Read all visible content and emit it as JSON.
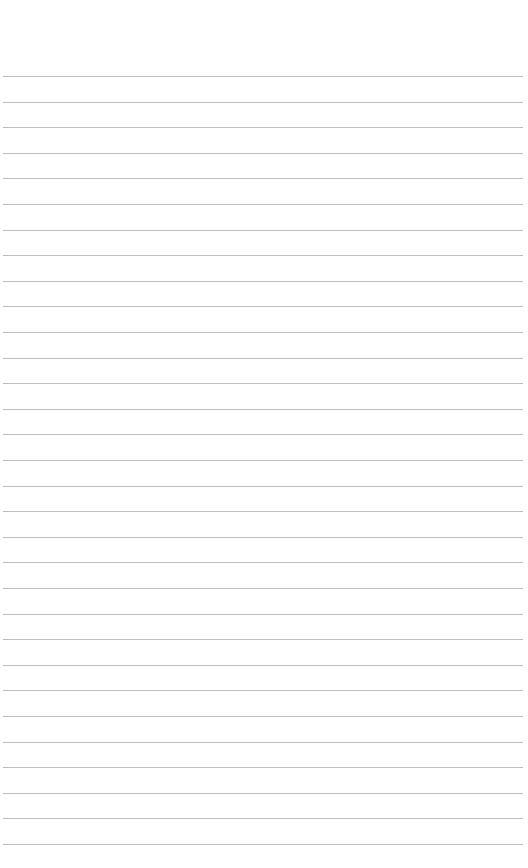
{
  "document": {
    "type": "ruled-paper",
    "background_color": "#ffffff",
    "rule_color": "#bdbdbd",
    "rule_count": 31,
    "first_rule_y": 76,
    "rule_spacing": 25.6,
    "rule_left_x": 3,
    "rule_right_x": 523,
    "text_content": []
  }
}
